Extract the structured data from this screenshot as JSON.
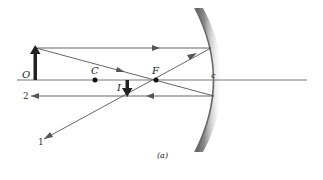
{
  "diagram": {
    "caption": "(a)",
    "labels": {
      "object": "O",
      "center": "C",
      "focal": "F",
      "vertex": "c",
      "image": "I",
      "ray1": "1",
      "ray2": "2"
    },
    "colors": {
      "ray": "#555555",
      "axis": "#666666",
      "arrow": "#222222",
      "mirror": "#7a7a7a"
    }
  }
}
